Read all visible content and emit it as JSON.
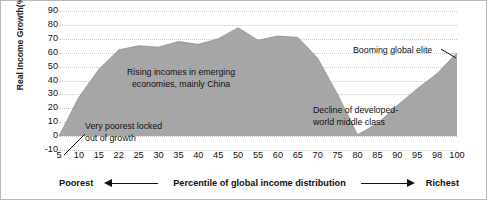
{
  "chart_data": {
    "type": "area",
    "title": "",
    "xlabel": "Percentile of global income distribution",
    "ylabel": "Real Income Growth(%)",
    "xlim": [
      5,
      100
    ],
    "ylim": [
      -10,
      90
    ],
    "grid": true,
    "legend": "none",
    "series_color": "#a6a6a6",
    "x_tick_labels": [
      "5",
      "10",
      "15",
      "22",
      "25",
      "30",
      "35",
      "40",
      "45",
      "50",
      "55",
      "60",
      "65",
      "70",
      "75",
      "80",
      "85",
      "90",
      "95",
      "98",
      "100"
    ],
    "y_tick_labels": [
      "90",
      "80",
      "70",
      "60",
      "50",
      "40",
      "30",
      "20",
      "10",
      "0",
      "-10"
    ],
    "x": [
      5,
      10,
      15,
      22,
      25,
      30,
      35,
      40,
      45,
      50,
      55,
      60,
      65,
      70,
      75,
      80,
      85,
      90,
      95,
      98,
      100
    ],
    "values": [
      0,
      28,
      48,
      62,
      65,
      64,
      68,
      66,
      70,
      78,
      69,
      72,
      71,
      56,
      30,
      1,
      9,
      22,
      34,
      45,
      60
    ],
    "series": [
      {
        "name": "Real income growth",
        "values": [
          0,
          28,
          48,
          62,
          65,
          64,
          68,
          66,
          70,
          78,
          69,
          72,
          71,
          56,
          30,
          1,
          9,
          22,
          34,
          45,
          60
        ]
      }
    ],
    "annotations": [
      {
        "id": "rising",
        "text": "Rising incomes in emerging\neconomies, mainly China",
        "x": 30,
        "y": 45
      },
      {
        "id": "poorest",
        "text": "Very poorest locked\nout of growth",
        "x": 15,
        "y": 12
      },
      {
        "id": "decline",
        "text": "Decline of developed-\nworld middle class",
        "x": 78,
        "y": 22
      },
      {
        "id": "booming",
        "text": "Booming global elite",
        "x": 95,
        "y": 62
      }
    ]
  },
  "axis_caption": {
    "left_label": "Poorest",
    "center_label": "Percentile of global income distribution",
    "right_label": "Richest",
    "left_arrow_icon": "arrow-left-icon",
    "right_arrow_icon": "arrow-right-icon"
  }
}
